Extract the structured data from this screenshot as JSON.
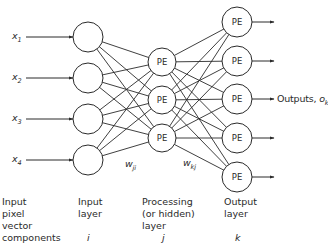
{
  "diagram": {
    "type": "feedforward-neural-network",
    "node_label": "PE",
    "colors": {
      "stroke": "#2a2a2a",
      "fill": "#ffffff",
      "text": "#2a2a2a"
    },
    "inputs": [
      {
        "var": "x",
        "sub": "1"
      },
      {
        "var": "x",
        "sub": "2"
      },
      {
        "var": "x",
        "sub": "3"
      },
      {
        "var": "x",
        "sub": "4"
      }
    ],
    "layers": {
      "input": {
        "count": 4,
        "node_text": ""
      },
      "hidden": {
        "count": 3,
        "node_text": "PE"
      },
      "output": {
        "count": 5,
        "node_text": "PE"
      }
    },
    "weights": {
      "input_hidden": {
        "var": "w",
        "sub": "ji"
      },
      "hidden_output": {
        "var": "w",
        "sub": "kj"
      }
    },
    "outputs_label": {
      "text": "Outputs, ",
      "var": "o",
      "sub": "k"
    },
    "captions": {
      "input_vector": {
        "lines": [
          "Input",
          "pixel",
          "vector",
          "components"
        ]
      },
      "input_layer": {
        "lines": [
          "Input",
          "layer"
        ],
        "index": "i"
      },
      "hidden_layer": {
        "lines": [
          "Processing",
          "(or hidden)",
          "layer"
        ],
        "index": "j"
      },
      "output_layer": {
        "lines": [
          "Output",
          "layer"
        ],
        "index": "k"
      }
    }
  }
}
